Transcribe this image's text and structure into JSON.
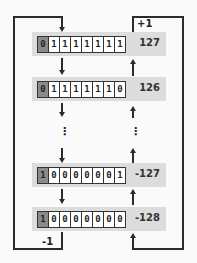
{
  "diagram": {
    "rows": [
      {
        "bits": [
          "0",
          "1",
          "1",
          "1",
          "1",
          "1",
          "1",
          "1"
        ],
        "value": "127"
      },
      {
        "bits": [
          "0",
          "1",
          "1",
          "1",
          "1",
          "1",
          "1",
          "0"
        ],
        "value": "126"
      },
      {
        "bits": [
          "1",
          "0",
          "0",
          "0",
          "0",
          "0",
          "0",
          "1"
        ],
        "value": "-127"
      },
      {
        "bits": [
          "1",
          "0",
          "0",
          "0",
          "0",
          "0",
          "0",
          "0"
        ],
        "value": "-128"
      }
    ],
    "ellipsis": "⋮",
    "increment_label": "+1",
    "decrement_label": "-1",
    "colors": {
      "band": "#dcdcdc",
      "sign_bit": "#8a8a8a",
      "line": "#2b2b2b"
    }
  }
}
